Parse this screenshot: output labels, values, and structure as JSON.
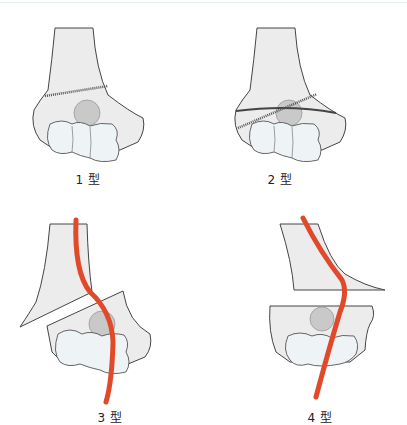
{
  "figure": {
    "colors": {
      "bone_fill": "#ececec",
      "bone_outline": "#444444",
      "articular_fill": "#eef3f6",
      "capitellum_fill": "#c9c9c9",
      "nerve_red": "#e04a2a",
      "fracture_line": "#555555"
    },
    "panels": [
      {
        "id": 1,
        "label": "1 型"
      },
      {
        "id": 2,
        "label": "2 型"
      },
      {
        "id": 3,
        "label": "3 型"
      },
      {
        "id": 4,
        "label": "4 型"
      }
    ]
  }
}
